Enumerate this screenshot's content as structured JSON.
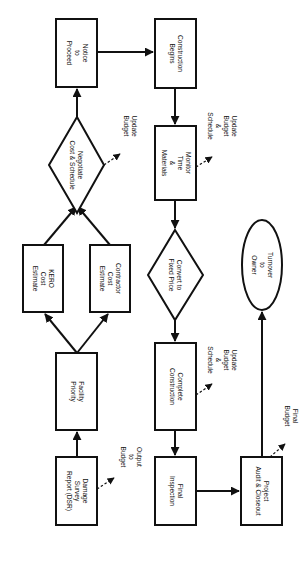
{
  "diagram": {
    "orientation": "rotated 90 degrees clockwise",
    "colors": {
      "stroke": "#111111",
      "background": "#ffffff"
    },
    "nodes": {
      "dsr": {
        "shape": "rectangle",
        "lines": [
          "Damage",
          "Survey",
          "Report (DSR)"
        ]
      },
      "facility_priority": {
        "shape": "rectangle",
        "lines": [
          "Facility",
          "Priority"
        ]
      },
      "kero_estimate": {
        "shape": "rectangle",
        "lines": [
          "KERO",
          "Cost",
          "Estimate"
        ]
      },
      "contractor_estimate": {
        "shape": "rectangle",
        "lines": [
          "Contractor",
          "Cost",
          "Estimate"
        ]
      },
      "negotiate": {
        "shape": "diamond",
        "lines": [
          "Negotiate",
          "Cost & Schedule"
        ]
      },
      "notice_to_proceed": {
        "shape": "rectangle",
        "lines": [
          "Notice",
          "to",
          "Proceed"
        ]
      },
      "construction_begins": {
        "shape": "rectangle",
        "lines": [
          "Construction",
          "Begins"
        ]
      },
      "monitor": {
        "shape": "rectangle",
        "lines": [
          "Monitor",
          "Time",
          "&",
          "Materials"
        ]
      },
      "convert": {
        "shape": "diamond",
        "lines": [
          "Convert to",
          "Fixed Price"
        ]
      },
      "complete_construction": {
        "shape": "rectangle",
        "lines": [
          "Complete",
          "Construction"
        ]
      },
      "final_inspection": {
        "shape": "rectangle",
        "lines": [
          "Final",
          "Inspection"
        ]
      },
      "project_audit": {
        "shape": "rectangle",
        "lines": [
          "Project",
          "Audit & Closeout"
        ]
      },
      "turnover": {
        "shape": "ellipse",
        "lines": [
          "Turnover",
          "to",
          "Owner"
        ]
      }
    },
    "notes": {
      "output_to_budget": [
        "Output",
        "to",
        "Budget"
      ],
      "update_budget": [
        "Update",
        "Budget"
      ],
      "update_budget_schedule_1": [
        "Update",
        "Budget",
        "&",
        "Schedule"
      ],
      "update_budget_schedule_2": [
        "Update",
        "Budget",
        "&",
        "Schedule"
      ],
      "final_budget": [
        "Final",
        "Budget"
      ]
    },
    "edges": [
      {
        "from": "dsr",
        "to": "facility_priority",
        "style": "solid"
      },
      {
        "from": "facility_priority",
        "to": "kero_estimate",
        "style": "solid"
      },
      {
        "from": "facility_priority",
        "to": "contractor_estimate",
        "style": "solid"
      },
      {
        "from": "kero_estimate",
        "to": "negotiate",
        "style": "solid"
      },
      {
        "from": "contractor_estimate",
        "to": "negotiate",
        "style": "solid"
      },
      {
        "from": "negotiate",
        "to": "notice_to_proceed",
        "style": "solid"
      },
      {
        "from": "notice_to_proceed",
        "to": "construction_begins",
        "style": "solid"
      },
      {
        "from": "construction_begins",
        "to": "monitor",
        "style": "solid"
      },
      {
        "from": "monitor",
        "to": "convert",
        "style": "solid"
      },
      {
        "from": "convert",
        "to": "complete_construction",
        "style": "solid"
      },
      {
        "from": "complete_construction",
        "to": "final_inspection",
        "style": "solid"
      },
      {
        "from": "final_inspection",
        "to": "project_audit",
        "style": "solid"
      },
      {
        "from": "project_audit",
        "to": "turnover",
        "style": "solid"
      },
      {
        "from": "dsr",
        "to": "output_to_budget",
        "style": "dashed"
      },
      {
        "from": "negotiate",
        "to": "update_budget",
        "style": "dashed"
      },
      {
        "from": "monitor",
        "to": "update_budget_schedule_1",
        "style": "dashed"
      },
      {
        "from": "complete_construction",
        "to": "update_budget_schedule_2",
        "style": "dashed"
      },
      {
        "from": "project_audit",
        "to": "final_budget",
        "style": "dashed"
      }
    ]
  }
}
